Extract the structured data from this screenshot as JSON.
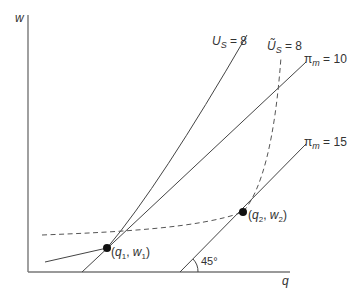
{
  "diagram": {
    "axes": {
      "y_label": "w",
      "x_label": "q"
    },
    "curves": {
      "us": {
        "label_main": "U",
        "label_sub": "S",
        "label_eq": " = 8"
      },
      "us_tilde": {
        "label_main": "Ũ",
        "label_sub": "S",
        "label_eq": " = 8"
      },
      "pi10": {
        "label_main": "π",
        "label_sub": "m",
        "label_eq": " = 10"
      },
      "pi15": {
        "label_main": "π",
        "label_sub": "m",
        "label_eq": " = 15"
      }
    },
    "points": {
      "p1": {
        "open": "(",
        "q": "q",
        "q_sub": "1",
        "sep": ", ",
        "w": "w",
        "w_sub": "1",
        "close": ")"
      },
      "p2": {
        "open": "(",
        "q": "q",
        "q_sub": "2",
        "sep": ", ",
        "w": "w",
        "w_sub": "2",
        "close": ")"
      }
    },
    "angle_label": "45°",
    "colors": {
      "line": "#444444",
      "dashed": "#555555",
      "axis": "#666666",
      "point": "#111111"
    }
  }
}
